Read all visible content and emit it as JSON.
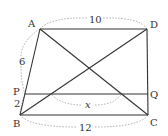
{
  "figure": {
    "type": "trapezoid",
    "vertices": {
      "A": {
        "label": "A",
        "x": 40,
        "y": 29
      },
      "D": {
        "label": "D",
        "x": 147,
        "y": 29
      },
      "B": {
        "label": "B",
        "x": 20,
        "y": 115
      },
      "C": {
        "label": "C",
        "x": 148,
        "y": 115
      },
      "P": {
        "label": "P",
        "x": 25,
        "y": 94
      },
      "Q": {
        "label": "Q",
        "x": 148,
        "y": 94
      }
    },
    "measurements": {
      "AD": "10",
      "AP": "6",
      "PB": "2",
      "PQ_segment": "x",
      "BC": "12"
    },
    "colors": {
      "line": "#333333",
      "dashed": "#999999"
    }
  }
}
